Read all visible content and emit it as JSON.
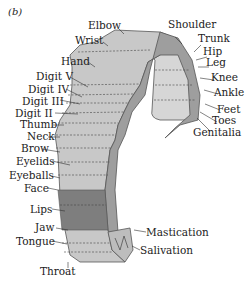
{
  "panel_label": "(b)",
  "colors": {
    "light_strip": "#c8c8c8",
    "dark_band": "#7e7e7e",
    "inner_edge": "#9e9e9e",
    "front_face": "#d6d6d6",
    "outline": "#555555"
  },
  "labels": {
    "elbow": "Elbow",
    "wrist": "Wrist",
    "hand": "Hand",
    "digit_v": "Digit V",
    "digit_iv": "Digit IV",
    "digit_iii": "Digit III",
    "digit_ii": "Digit II",
    "thumb": "Thumb",
    "neck": "Neck",
    "brow": "Brow",
    "eyelids": "Eyelids",
    "eyeballs": "Eyeballs",
    "face": "Face",
    "lips": "Lips",
    "jaw": "Jaw",
    "tongue": "Tongue",
    "throat": "Throat",
    "shoulder": "Shoulder",
    "trunk": "Trunk",
    "hip": "Hip",
    "leg": "Leg",
    "knee": "Knee",
    "ankle": "Ankle",
    "feet": "Feet",
    "toes": "Toes",
    "genitalia": "Genitalia",
    "mastication": "Mastication",
    "salivation": "Salivation"
  }
}
